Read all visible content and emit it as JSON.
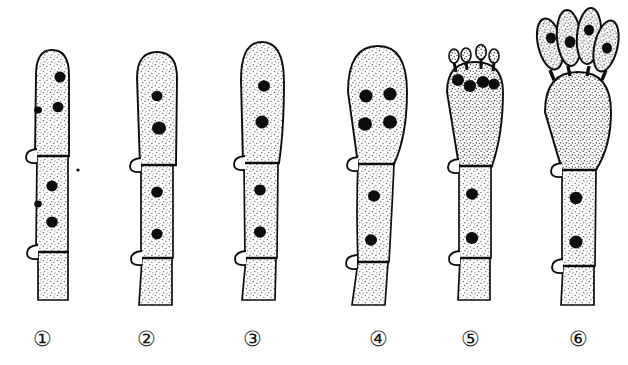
{
  "figure": {
    "background_color": "#ffffff",
    "ink_color": "#0d0d0d",
    "stipple_color": "#3a3a3a",
    "width": 628,
    "height": 365,
    "label_color": "#111111"
  },
  "labels": [
    {
      "name": "stage-label-1",
      "text": "①",
      "x": 42,
      "y": 326
    },
    {
      "name": "stage-label-2",
      "text": "②",
      "x": 146,
      "y": 326
    },
    {
      "name": "stage-label-3",
      "text": "③",
      "x": 252,
      "y": 326
    },
    {
      "name": "stage-label-4",
      "text": "④",
      "x": 378,
      "y": 326
    },
    {
      "name": "stage-label-5",
      "text": "⑤",
      "x": 470,
      "y": 326
    },
    {
      "name": "stage-label-6",
      "text": "⑥",
      "x": 578,
      "y": 326
    }
  ],
  "stages": [
    {
      "id": 1,
      "label": "①",
      "center_x": 52,
      "apex_y": 50,
      "base_y": 300,
      "apex_width": 34,
      "apex_shape": "narrow-cylindrical-rounded",
      "apex_height": 105,
      "stalk_width": 30,
      "nuclei_in_apical_cell": 2,
      "nuclei_in_second_cell": 2,
      "septa_count": 2,
      "clamp_connections": 2,
      "sterigmata": 0,
      "spores": 0,
      "apex_nuclei": [
        {
          "x": 8,
          "y": 68
        },
        {
          "x": 6,
          "y": 98
        }
      ],
      "stalk_nuclei": [
        {
          "x": 0,
          "y": 145
        },
        {
          "x": 0,
          "y": 180
        }
      ]
    },
    {
      "id": 2,
      "label": "②",
      "center_x": 157,
      "apex_y": 52,
      "base_y": 305,
      "apex_width": 40,
      "apex_shape": "slightly-swollen-rounded",
      "apex_height": 110,
      "stalk_width": 30,
      "nuclei_in_apical_cell": 2,
      "nuclei_in_second_cell": 2,
      "septa_count": 2,
      "clamp_connections": 2,
      "sterigmata": 0,
      "spores": 0,
      "apex_nuclei": [
        {
          "x": 0,
          "y": 78
        },
        {
          "x": 2,
          "y": 106
        }
      ],
      "stalk_nuclei": [
        {
          "x": 0,
          "y": 148
        },
        {
          "x": 0,
          "y": 188
        }
      ]
    },
    {
      "id": 3,
      "label": "③",
      "center_x": 262,
      "apex_y": 42,
      "base_y": 300,
      "apex_width": 44,
      "apex_shape": "elongate-club",
      "apex_height": 120,
      "stalk_width": 32,
      "nuclei_in_apical_cell": 2,
      "nuclei_in_second_cell": 2,
      "septa_count": 2,
      "clamp_connections": 2,
      "sterigmata": 0,
      "spores": 0,
      "apex_nuclei": [
        {
          "x": 2,
          "y": 72
        },
        {
          "x": 0,
          "y": 105
        }
      ],
      "stalk_nuclei": [
        {
          "x": 0,
          "y": 148
        },
        {
          "x": 0,
          "y": 192
        }
      ]
    },
    {
      "id": 4,
      "label": "④",
      "center_x": 377,
      "apex_y": 46,
      "base_y": 305,
      "apex_width": 58,
      "apex_shape": "broad-ovoid-swollen",
      "apex_height": 110,
      "stalk_width": 30,
      "nuclei_in_apical_cell": 4,
      "nuclei_in_second_cell": 2,
      "septa_count": 2,
      "clamp_connections": 2,
      "sterigmata": 0,
      "spores": 0,
      "apex_nuclei": [
        {
          "x": -12,
          "y": 76
        },
        {
          "x": 12,
          "y": 74
        },
        {
          "x": -12,
          "y": 104
        },
        {
          "x": 12,
          "y": 102
        }
      ],
      "stalk_nuclei": [
        {
          "x": 0,
          "y": 160
        },
        {
          "x": -2,
          "y": 200
        }
      ]
    },
    {
      "id": 5,
      "label": "⑤",
      "center_x": 475,
      "apex_y": 48,
      "base_y": 300,
      "apex_width": 58,
      "apex_shape": "clavate-with-sterigmata",
      "apex_height": 105,
      "stalk_width": 30,
      "nuclei_in_apical_cell": 4,
      "nuclei_in_second_cell": 2,
      "septa_count": 2,
      "clamp_connections": 2,
      "sterigmata": 4,
      "spores": 4,
      "spore_size": "young-small",
      "apex_nuclei": [
        {
          "x": -14,
          "y": 66
        },
        {
          "x": -4,
          "y": 72
        },
        {
          "x": 8,
          "y": 68
        },
        {
          "x": 18,
          "y": 72
        }
      ],
      "stalk_nuclei": [
        {
          "x": 0,
          "y": 158
        },
        {
          "x": 0,
          "y": 200
        }
      ]
    },
    {
      "id": 6,
      "label": "⑥",
      "center_x": 578,
      "apex_y": 50,
      "base_y": 305,
      "apex_width": 66,
      "apex_shape": "broad-clavate-mature",
      "apex_height": 115,
      "stalk_width": 32,
      "nuclei_in_apical_cell": 0,
      "nuclei_in_second_cell": 2,
      "septa_count": 2,
      "clamp_connections": 2,
      "sterigmata": 4,
      "spores": 4,
      "spore_size": "mature-large",
      "spore_nuclei": 4,
      "apex_nuclei": [],
      "stalk_nuclei": [
        {
          "x": 0,
          "y": 170
        },
        {
          "x": 0,
          "y": 212
        }
      ]
    }
  ]
}
